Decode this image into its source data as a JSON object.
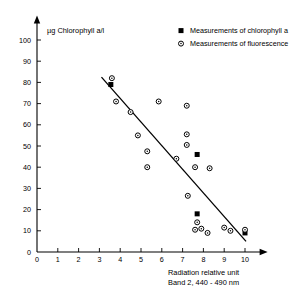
{
  "chart_data": {
    "type": "scatter",
    "title": "",
    "ylabel": "µg Chlorophyll a/l",
    "xlabel_line1": "Radiation relative unit",
    "xlabel_line2": "Band 2, 440 - 490 nm",
    "xlim": [
      0,
      10.8
    ],
    "ylim": [
      0,
      105
    ],
    "xticks": [
      0,
      1,
      2,
      3,
      4,
      5,
      6,
      7,
      8,
      9,
      10
    ],
    "xtick_labels": [
      "0",
      "1",
      "2",
      "3",
      "4",
      "5",
      "6",
      "7",
      "8",
      "9",
      "10"
    ],
    "yticks": [
      0,
      10,
      20,
      30,
      40,
      50,
      60,
      70,
      80,
      90,
      100
    ],
    "ytick_labels": [
      "0",
      "10",
      "20",
      "30",
      "40",
      "50",
      "60",
      "70",
      "80",
      "90",
      "100"
    ],
    "grid": false,
    "legend_position": "top-right",
    "legend": [
      {
        "marker": "filled-square",
        "label": "Measurements of chlorophyll a"
      },
      {
        "marker": "open-circle",
        "label": "Measurements of fluorescence"
      }
    ],
    "series": [
      {
        "name": "Measurements of chlorophyll a",
        "marker": "filled-square",
        "points": [
          [
            3.55,
            79.0
          ],
          [
            7.7,
            46.0
          ],
          [
            7.7,
            18.0
          ],
          [
            10.0,
            9.0
          ]
        ]
      },
      {
        "name": "Measurements of fluorescence",
        "marker": "open-circle",
        "points": [
          [
            3.6,
            82.0
          ],
          [
            3.8,
            71.0
          ],
          [
            4.5,
            66.0
          ],
          [
            4.85,
            55.0
          ],
          [
            5.3,
            47.5
          ],
          [
            5.3,
            40.0
          ],
          [
            5.85,
            71.0
          ],
          [
            6.7,
            44.0
          ],
          [
            7.2,
            69.0
          ],
          [
            7.2,
            55.5
          ],
          [
            7.2,
            50.5
          ],
          [
            7.25,
            26.5
          ],
          [
            7.6,
            40.0
          ],
          [
            7.6,
            10.5
          ],
          [
            7.7,
            14.0
          ],
          [
            7.9,
            11.0
          ],
          [
            8.2,
            9.0
          ],
          [
            8.3,
            39.5
          ],
          [
            9.0,
            11.5
          ],
          [
            9.3,
            10.0
          ],
          [
            10.0,
            10.5
          ]
        ]
      }
    ],
    "trendline": {
      "name": "regression-line",
      "x_start": 3.1,
      "y_start": 82.5,
      "x_end": 10.05,
      "y_end": 5.0
    }
  }
}
